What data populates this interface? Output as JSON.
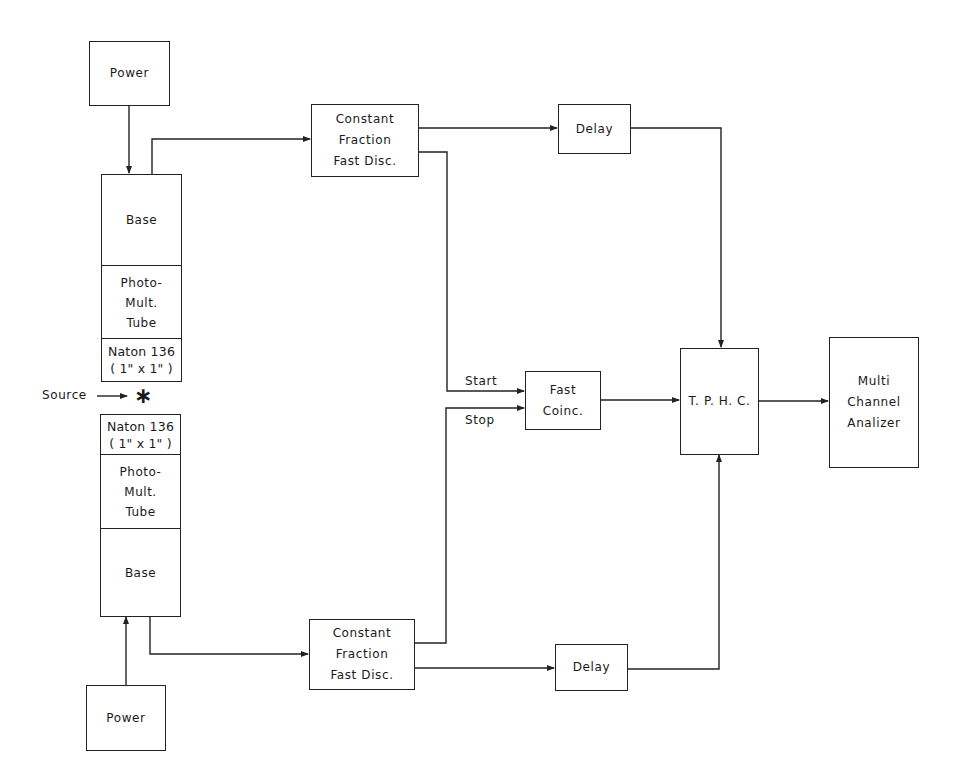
{
  "diagram": {
    "type": "block-diagram",
    "title": "",
    "nodes": {
      "power_top": {
        "label": [
          "Power"
        ]
      },
      "detector_top": {
        "base": [
          "Base"
        ],
        "pmt": [
          "Photo-",
          "Mult.",
          "Tube"
        ],
        "scintillator": [
          "Naton 136",
          "( 1\" x 1\" )"
        ]
      },
      "source": {
        "label": "Source",
        "symbol": "∗"
      },
      "detector_bottom": {
        "scintillator": [
          "Naton 136",
          "( 1\" x 1\" )"
        ],
        "pmt": [
          "Photo-",
          "Mult.",
          "Tube"
        ],
        "base": [
          "Base"
        ]
      },
      "power_bottom": {
        "label": [
          "Power"
        ]
      },
      "cfd_top": {
        "label": [
          "Constant",
          "Fraction",
          "Fast Disc."
        ]
      },
      "cfd_bottom": {
        "label": [
          "Constant",
          "Fraction",
          "Fast Disc."
        ]
      },
      "delay_top": {
        "label": [
          "Delay"
        ]
      },
      "delay_bottom": {
        "label": [
          "Delay"
        ]
      },
      "fast_coinc": {
        "label": [
          "Fast",
          "Coinc."
        ]
      },
      "tphc": {
        "label": [
          "T. P. H. C."
        ]
      },
      "mca": {
        "label": [
          "Multi",
          "Channel",
          "Analizer"
        ]
      }
    },
    "edge_labels": {
      "start": "Start",
      "stop": "Stop"
    },
    "edges": [
      {
        "from": "power_top",
        "to": "detector_top.base"
      },
      {
        "from": "detector_top.base",
        "to": "cfd_top"
      },
      {
        "from": "cfd_top",
        "to": "delay_top"
      },
      {
        "from": "cfd_top",
        "to": "fast_coinc",
        "label": "Start"
      },
      {
        "from": "delay_top",
        "to": "tphc"
      },
      {
        "from": "power_bottom",
        "to": "detector_bottom.base"
      },
      {
        "from": "detector_bottom.base",
        "to": "cfd_bottom"
      },
      {
        "from": "cfd_bottom",
        "to": "delay_bottom"
      },
      {
        "from": "cfd_bottom",
        "to": "fast_coinc",
        "label": "Stop"
      },
      {
        "from": "delay_bottom",
        "to": "tphc"
      },
      {
        "from": "fast_coinc",
        "to": "tphc"
      },
      {
        "from": "tphc",
        "to": "mca"
      },
      {
        "from": "source",
        "to": "detectors"
      }
    ]
  }
}
